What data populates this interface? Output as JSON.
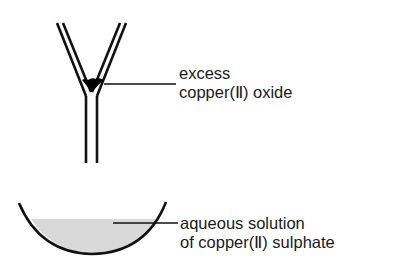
{
  "diagram": {
    "type": "apparatus",
    "components": [
      {
        "id": "funnel",
        "name": "filter funnel"
      },
      {
        "id": "basin",
        "name": "evaporating basin"
      }
    ],
    "labels": {
      "funnel": {
        "line1": "excess",
        "line2": "copper(Ⅱ) oxide"
      },
      "basin": {
        "line1": "aqueous solution",
        "line2": "of copper(Ⅱ) sulphate"
      }
    },
    "colors": {
      "stroke": "#111111",
      "solid": "#000000",
      "solution": "#d9d9d9"
    }
  }
}
